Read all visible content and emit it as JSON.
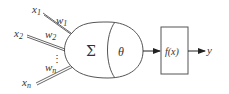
{
  "diagram": {
    "inputs": [
      {
        "label": "x1",
        "weight": "w1"
      },
      {
        "label": "x2",
        "weight": "w2"
      },
      {
        "label": "xn",
        "weight": "wn"
      }
    ],
    "ellipsis": "⋮",
    "summation_symbol": "Σ",
    "threshold_symbol": "θ",
    "activation_label": "f(x)",
    "output_label": "y",
    "stroke_color": "#555555"
  }
}
